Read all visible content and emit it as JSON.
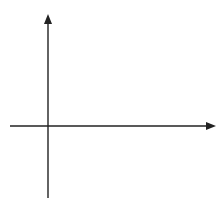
{
  "header": {
    "partial_text": "y ... g ..."
  },
  "diagram": {
    "axes": {
      "x_label": "x",
      "y_label": "y",
      "origin_label": "0",
      "x_ticks": [
        "-1",
        "1",
        "2",
        "3",
        "4",
        "5",
        "6",
        "7",
        "8"
      ],
      "y_ticks": [
        "-3",
        "-2",
        "-1",
        "1",
        "2",
        "3",
        "4",
        "5"
      ]
    },
    "points": [
      {
        "name": "P",
        "x": 1,
        "y": 3
      },
      {
        "name": "Q",
        "x": 1,
        "y": 1
      },
      {
        "name": "R",
        "x": 4,
        "y": 3
      }
    ],
    "colors": {
      "grid": "#d9d9d9",
      "axis": "#222222",
      "shape": "#222222"
    }
  }
}
